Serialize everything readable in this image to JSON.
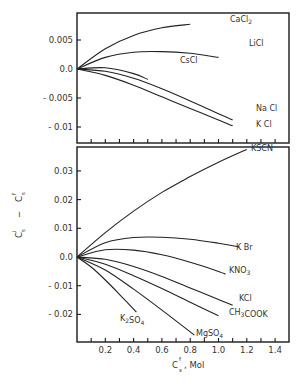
{
  "chart_data": [
    {
      "type": "line",
      "panel": "upper",
      "title": "",
      "xlabel": "C_s^f, Mol",
      "ylabel": "C_s^i − C_s^f",
      "xlim": [
        0,
        1.5
      ],
      "ylim": [
        -0.0115,
        0.0095
      ],
      "yticks": [
        "0.005",
        "0.0",
        "- 0.005",
        "- 0.01"
      ],
      "grid": false,
      "series": [
        {
          "name": "CaCl2",
          "label": "CaCl",
          "sub": "2",
          "x": [
            0,
            0.2,
            0.4,
            0.6,
            0.8
          ],
          "y": [
            0,
            0.0035,
            0.0058,
            0.0071,
            0.0077
          ]
        },
        {
          "name": "LiCl",
          "label": "LiCl",
          "x": [
            0,
            0.2,
            0.4,
            0.6,
            0.8,
            1.0
          ],
          "y": [
            0,
            0.002,
            0.0029,
            0.003,
            0.0027,
            0.002
          ]
        },
        {
          "name": "CsCl",
          "label": "CsCl",
          "x": [
            0,
            0.2,
            0.4,
            0.5
          ],
          "y": [
            0,
            0.0002,
            -0.0008,
            -0.0018
          ]
        },
        {
          "name": "NaCl",
          "label": "Na Cl",
          "x": [
            0,
            0.2,
            0.4,
            0.6,
            0.8,
            1.0,
            1.1
          ],
          "y": [
            0,
            -0.0004,
            -0.0016,
            -0.0034,
            -0.0055,
            -0.0077,
            -0.0088
          ]
        },
        {
          "name": "KCl",
          "label": "K Cl",
          "x": [
            0,
            0.2,
            0.4,
            0.6,
            0.8,
            1.0,
            1.1
          ],
          "y": [
            0,
            -0.0011,
            -0.0028,
            -0.0048,
            -0.0068,
            -0.0088,
            -0.0098
          ]
        }
      ]
    },
    {
      "type": "line",
      "panel": "lower",
      "title": "",
      "xlabel": "C_s^f, Mol",
      "ylabel": "C_s^i − C_s^f",
      "xlim": [
        0,
        1.5
      ],
      "ylim": [
        -0.03,
        0.04
      ],
      "xticks": [
        "0.2",
        "0.4",
        "0.6",
        "0.8",
        "1.0",
        "1.2",
        "1.4"
      ],
      "yticks": [
        "0.03",
        "0.02",
        "0.01",
        "0.0",
        "- 0.01",
        "- 0.02"
      ],
      "grid": false,
      "series": [
        {
          "name": "KSCN",
          "label": "KSCN",
          "x": [
            0,
            0.2,
            0.4,
            0.6,
            0.8,
            1.0,
            1.2
          ],
          "y": [
            0,
            0.0085,
            0.016,
            0.0225,
            0.028,
            0.033,
            0.0375
          ]
        },
        {
          "name": "KBr",
          "label": "K Br",
          "x": [
            0,
            0.2,
            0.4,
            0.6,
            0.8,
            1.0,
            1.15
          ],
          "y": [
            0,
            0.005,
            0.0068,
            0.0069,
            0.0062,
            0.0048,
            0.0035
          ]
        },
        {
          "name": "KNO3",
          "label": "KNO",
          "sub": "3",
          "x": [
            0,
            0.2,
            0.4,
            0.6,
            0.8,
            1.0,
            1.05
          ],
          "y": [
            0,
            0.0025,
            0.0024,
            0.0008,
            -0.0018,
            -0.005,
            -0.006
          ]
        },
        {
          "name": "KCl",
          "label": "KCl",
          "x": [
            0,
            0.2,
            0.4,
            0.6,
            0.8,
            1.0,
            1.1
          ],
          "y": [
            0,
            -0.0008,
            -0.0033,
            -0.0068,
            -0.0108,
            -0.0148,
            -0.0168
          ]
        },
        {
          "name": "CH3COOK",
          "label": "CH",
          "sub": "3",
          "label2": "COOK",
          "x": [
            0,
            0.2,
            0.4,
            0.6,
            0.8,
            1.0
          ],
          "y": [
            0,
            -0.0025,
            -0.0065,
            -0.011,
            -0.0158,
            -0.0205
          ]
        },
        {
          "name": "MgSO4",
          "label": "MgSO",
          "sub": "4",
          "x": [
            0,
            0.2,
            0.4,
            0.6,
            0.83
          ],
          "y": [
            0,
            -0.0045,
            -0.0112,
            -0.0185,
            -0.0272
          ]
        },
        {
          "name": "K2SO4",
          "label": "K",
          "sub": "2",
          "label2": "SO",
          "sub2": "4",
          "x": [
            0,
            0.1,
            0.2,
            0.3,
            0.42
          ],
          "y": [
            0,
            -0.0035,
            -0.008,
            -0.013,
            -0.0192
          ]
        }
      ]
    }
  ],
  "labels": {
    "ylabel_main": "C",
    "ylabel_i": "i",
    "ylabel_s": "s",
    "ylabel_minus": "−",
    "ylabel_f": "f",
    "xlabel_main": "C",
    "xlabel_f": "f",
    "xlabel_s": "s",
    "xlabel_unit": ", Mol"
  }
}
